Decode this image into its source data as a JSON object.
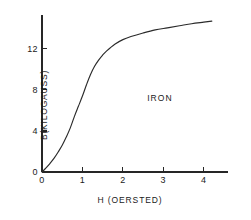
{
  "chart_data": {
    "type": "line",
    "title": "",
    "subtitle": "",
    "xlabel": "H (OERSTED)",
    "ylabel": "B(KILOGAUSS)",
    "xlim": [
      0,
      4.6
    ],
    "ylim": [
      0,
      15.3
    ],
    "xticks": [
      "0",
      "1",
      "2",
      "3",
      "4"
    ],
    "xtick_values": [
      0,
      1,
      2,
      3,
      4
    ],
    "yticks": [
      "0",
      "4",
      "8",
      "12"
    ],
    "ytick_values": [
      0,
      4,
      8,
      12
    ],
    "grid": false,
    "legend": false,
    "legend_position": "none",
    "annotations": [
      {
        "text": "IRON",
        "x": 2.6,
        "y": 7.7
      }
    ],
    "series": [
      {
        "name": "IRON",
        "color": "#2b2b2b",
        "x": [
          0,
          0.1,
          0.2,
          0.3,
          0.4,
          0.5,
          0.6,
          0.7,
          0.8,
          0.9,
          1.0,
          1.1,
          1.2,
          1.3,
          1.4,
          1.5,
          1.6,
          1.8,
          2.0,
          2.2,
          2.5,
          2.8,
          3.1,
          3.4,
          3.7,
          4.0,
          4.2
        ],
        "y": [
          0.0,
          0.4,
          0.85,
          1.35,
          1.95,
          2.6,
          3.4,
          4.3,
          5.4,
          6.4,
          7.4,
          8.5,
          9.5,
          10.3,
          10.9,
          11.4,
          11.8,
          12.45,
          12.9,
          13.2,
          13.55,
          13.85,
          14.05,
          14.25,
          14.45,
          14.6,
          14.7
        ]
      }
    ]
  },
  "axes": {
    "x_axis_name": "H (OERSTED)",
    "y_axis_name": "B(KILOGAUSS)"
  }
}
